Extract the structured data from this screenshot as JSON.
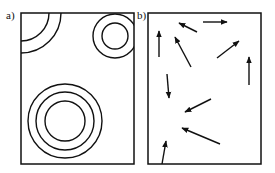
{
  "panels": {
    "a": {
      "label": "a)",
      "frame": {
        "x": 21,
        "y": 13,
        "width": 113,
        "height": 151
      },
      "circle_groups": [
        {
          "name": "top-left-quarter-arcs",
          "cx": 21,
          "cy": 13,
          "radii": [
            28,
            40
          ]
        },
        {
          "name": "top-right-rings",
          "cx": 115,
          "cy": 36,
          "radii": [
            13,
            22
          ]
        },
        {
          "name": "bottom-rings",
          "cx": 65,
          "cy": 121,
          "radii": [
            20,
            29,
            37
          ]
        }
      ]
    },
    "b": {
      "label": "b)",
      "frame": {
        "x": 148,
        "y": 13,
        "width": 113,
        "height": 151
      },
      "arrows": [
        {
          "x1": 159,
          "y1": 57,
          "x2": 159,
          "y2": 31
        },
        {
          "x1": 197,
          "y1": 32,
          "x2": 179,
          "y2": 23
        },
        {
          "x1": 191,
          "y1": 67,
          "x2": 175,
          "y2": 37
        },
        {
          "x1": 203,
          "y1": 22,
          "x2": 227,
          "y2": 22
        },
        {
          "x1": 217,
          "y1": 58,
          "x2": 239,
          "y2": 41
        },
        {
          "x1": 249,
          "y1": 85,
          "x2": 249,
          "y2": 57
        },
        {
          "x1": 167,
          "y1": 74,
          "x2": 169,
          "y2": 98
        },
        {
          "x1": 211,
          "y1": 99,
          "x2": 185,
          "y2": 112
        },
        {
          "x1": 220,
          "y1": 144,
          "x2": 182,
          "y2": 128
        },
        {
          "x1": 162,
          "y1": 164,
          "x2": 166,
          "y2": 141
        }
      ]
    }
  },
  "colors": {
    "stroke": "#111111",
    "background": "#ffffff"
  }
}
